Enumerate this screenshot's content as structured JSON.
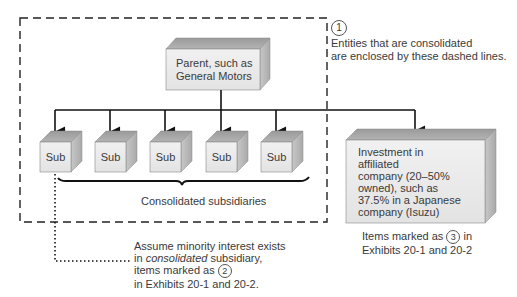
{
  "diagram": {
    "boundary_note": {
      "marker": "1",
      "line1": "Entities that are consolidated",
      "line2": "are enclosed by these dashed lines."
    },
    "parent": {
      "line1": "Parent, such as",
      "line2": "General Motors"
    },
    "subsidiaries": [
      {
        "label": "Sub"
      },
      {
        "label": "Sub"
      },
      {
        "label": "Sub"
      },
      {
        "label": "Sub"
      },
      {
        "label": "Sub"
      }
    ],
    "subsidiaries_caption": "Consolidated subsidiaries",
    "affiliate": {
      "lines": [
        "Investment in",
        "affiliated",
        "company (20–50%",
        "owned), such as",
        "37.5% in a Japanese",
        "company (Isuzu)"
      ]
    },
    "affiliate_note": {
      "prefix": "Items marked as",
      "marker": "3",
      "suffix": "in",
      "line2": "Exhibits 20-1 and 20-2"
    },
    "minority_note": {
      "line1": "Assume minority interest exists",
      "line2_prefix": "in",
      "line2_italic": "consolidated",
      "line2_suffix": "subsidiary,",
      "line3_prefix": "items marked as",
      "line3_marker": "2",
      "line4": "in Exhibits 20-1 and 20-2."
    },
    "colors": {
      "front_face": "#ececec",
      "top_face": "#a8a8a8",
      "side_face": "#c4c4c4",
      "line": "#1a1a1a",
      "text": "#3a3a3a"
    }
  }
}
